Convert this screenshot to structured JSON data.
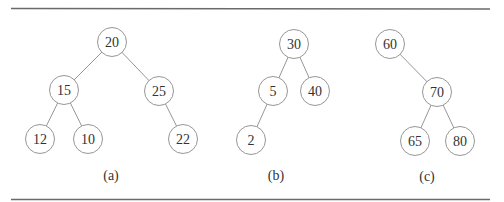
{
  "figure": {
    "trees": [
      {
        "caption": "(a)",
        "nodes": [
          {
            "id": "a20",
            "label": "20"
          },
          {
            "id": "a15",
            "label": "15"
          },
          {
            "id": "a25",
            "label": "25"
          },
          {
            "id": "a12",
            "label": "12"
          },
          {
            "id": "a10",
            "label": "10"
          },
          {
            "id": "a22",
            "label": "22"
          }
        ],
        "edges": [
          [
            "a20",
            "a15"
          ],
          [
            "a20",
            "a25"
          ],
          [
            "a15",
            "a12"
          ],
          [
            "a15",
            "a10"
          ],
          [
            "a25",
            "a22"
          ]
        ]
      },
      {
        "caption": "(b)",
        "nodes": [
          {
            "id": "b30",
            "label": "30"
          },
          {
            "id": "b5",
            "label": "5"
          },
          {
            "id": "b40",
            "label": "40"
          },
          {
            "id": "b2",
            "label": "2"
          }
        ],
        "edges": [
          [
            "b30",
            "b5"
          ],
          [
            "b30",
            "b40"
          ],
          [
            "b5",
            "b2"
          ]
        ]
      },
      {
        "caption": "(c)",
        "nodes": [
          {
            "id": "c60",
            "label": "60"
          },
          {
            "id": "c70",
            "label": "70"
          },
          {
            "id": "c65",
            "label": "65"
          },
          {
            "id": "c80",
            "label": "80"
          }
        ],
        "edges": [
          [
            "c60",
            "c70"
          ],
          [
            "c70",
            "c65"
          ],
          [
            "c70",
            "c80"
          ]
        ]
      }
    ]
  }
}
